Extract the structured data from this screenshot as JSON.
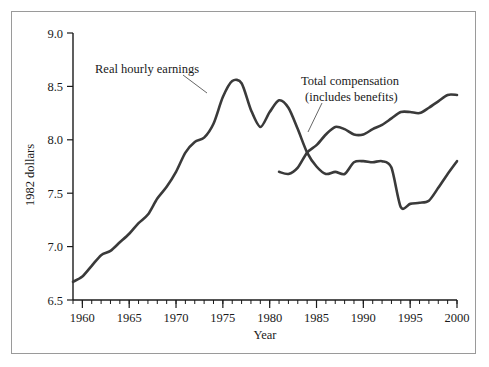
{
  "chart_data": {
    "type": "line",
    "title": "",
    "xlabel": "Year",
    "ylabel": "1982 dollars",
    "xlim": [
      1959,
      2000
    ],
    "ylim": [
      6.5,
      9.0
    ],
    "grid": false,
    "legend_position": "inline-annotations",
    "x_ticks_major": [
      1960,
      1965,
      1970,
      1975,
      1980,
      1985,
      1990,
      1995,
      2000
    ],
    "x_tick_labels": [
      "1960",
      "1965",
      "1970",
      "1975",
      "1980",
      "1985",
      "1990",
      "1995",
      "2000"
    ],
    "x_minor_tick_interval": 1,
    "y_ticks": [
      6.5,
      7.0,
      7.5,
      8.0,
      8.5,
      9.0
    ],
    "y_tick_labels": [
      "6.5",
      "7.0",
      "7.5",
      "8.0",
      "8.5",
      "9.0"
    ],
    "line_color": "#3a3a3a",
    "annotations": [
      {
        "name": "real-hourly-earnings-label",
        "text": "Real hourly earnings",
        "lines": [
          "Real hourly earnings"
        ],
        "x": 1973,
        "y": 8.55
      },
      {
        "name": "total-compensation-label",
        "text": "Total compensation (includes benefits)",
        "lines": [
          "Total compensation",
          "(includes benefits)"
        ],
        "x": 1985,
        "y": 8.12
      }
    ],
    "series": [
      {
        "name": "Real hourly earnings",
        "x": [
          1959,
          1960,
          1961,
          1962,
          1963,
          1964,
          1965,
          1966,
          1967,
          1968,
          1969,
          1970,
          1971,
          1972,
          1973,
          1974,
          1975,
          1976,
          1977,
          1978,
          1979,
          1980,
          1981,
          1982,
          1983,
          1984,
          1985,
          1986,
          1987,
          1988,
          1989,
          1990,
          1991,
          1992,
          1993,
          1994,
          1995,
          1996,
          1997,
          1998,
          1999,
          2000
        ],
        "values": [
          6.67,
          6.72,
          6.82,
          6.92,
          6.96,
          7.04,
          7.12,
          7.22,
          7.3,
          7.45,
          7.56,
          7.7,
          7.88,
          7.98,
          8.02,
          8.15,
          8.4,
          8.55,
          8.53,
          8.28,
          8.12,
          8.26,
          8.37,
          8.3,
          8.1,
          7.88,
          7.75,
          7.68,
          7.7,
          7.68,
          7.79,
          7.8,
          7.79,
          7.8,
          7.74,
          7.68,
          7.6,
          7.54,
          7.47,
          7.43,
          7.39,
          7.38
        ]
      },
      {
        "name": "Total compensation (includes benefits)",
        "x": [
          1981,
          1982,
          1983,
          1984,
          1985,
          1986,
          1987,
          1988,
          1989,
          1990,
          1991,
          1992,
          1993,
          1994,
          1995,
          1996,
          1997,
          1998,
          1999,
          2000
        ],
        "values": [
          7.7,
          7.68,
          7.74,
          7.88,
          7.95,
          8.05,
          8.12,
          8.1,
          8.05,
          8.05,
          8.1,
          8.14,
          8.2,
          8.26,
          8.26,
          8.25,
          8.3,
          8.36,
          8.42,
          8.42
        ]
      }
    ],
    "series_note": {
      "real_hourly_earnings_tail_after_1993": "continues from 7.38 (1993) dipping to 7.37 (1994), flat ~7.40 (1995-1997), rising to 7.55 (1998), 7.68 (1999), 7.8 (2000)",
      "overlap": "Both series trace the same path from 1959 to about 1981 before diverging"
    }
  }
}
